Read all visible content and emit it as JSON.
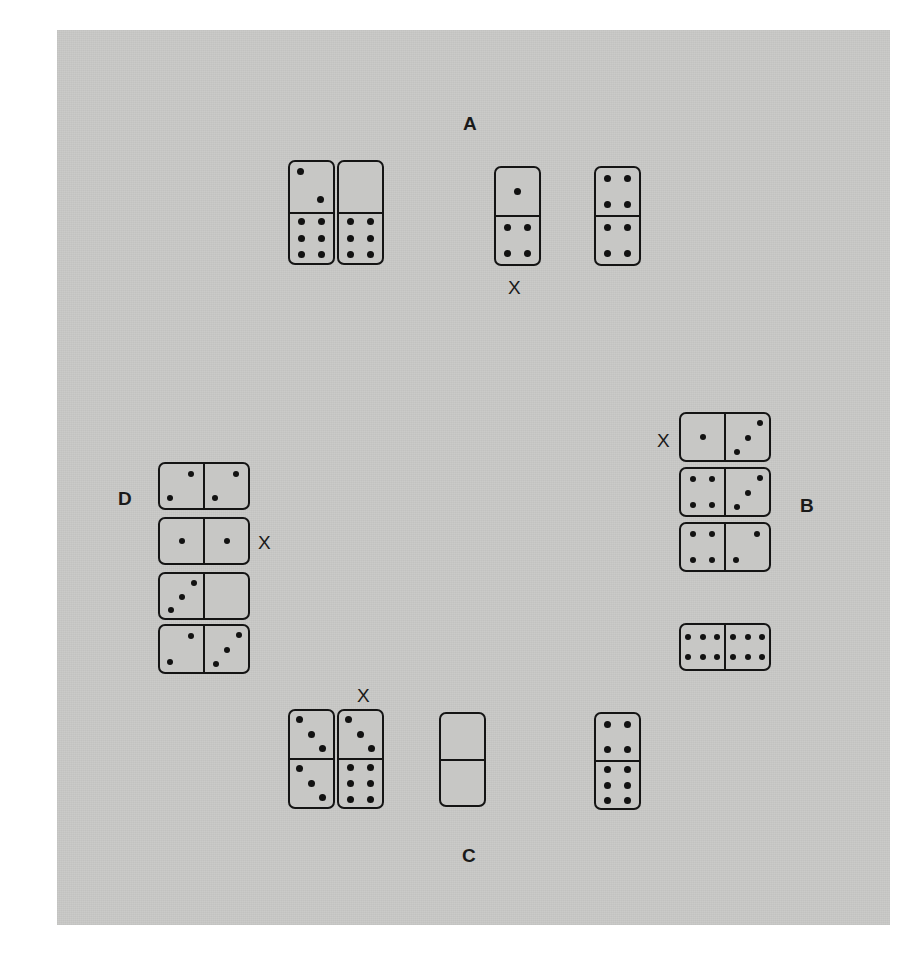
{
  "page": {
    "background_color": "#ffffff",
    "board_color": "#c9c9c7",
    "ink_color": "#141414"
  },
  "groups": [
    {
      "id": "A",
      "label": "A",
      "label_x": 463,
      "label_y": 113,
      "orientation": "vertical",
      "marked_index": 2,
      "mark_label": "X",
      "mark_x": 508,
      "mark_y": 277,
      "dominoes": [
        {
          "name": "domino-a1",
          "x": 288,
          "y": 160,
          "w": 47,
          "h": 105,
          "first": 2,
          "second": 6,
          "first_layout": "diag2-nw-se",
          "second_layout": "6"
        },
        {
          "name": "domino-a2",
          "x": 337,
          "y": 160,
          "w": 47,
          "h": 105,
          "first": 0,
          "second": 6,
          "first_layout": "0",
          "second_layout": "6"
        },
        {
          "name": "domino-a3",
          "x": 494,
          "y": 166,
          "w": 47,
          "h": 100,
          "first": 1,
          "second": 4,
          "first_layout": "1",
          "second_layout": "4"
        },
        {
          "name": "domino-a4",
          "x": 594,
          "y": 166,
          "w": 47,
          "h": 100,
          "first": 4,
          "second": 4,
          "first_layout": "4",
          "second_layout": "4"
        }
      ]
    },
    {
      "id": "B",
      "label": "B",
      "label_x": 800,
      "label_y": 495,
      "orientation": "horizontal",
      "marked_index": 0,
      "mark_label": "X",
      "mark_x": 657,
      "mark_y": 430,
      "dominoes": [
        {
          "name": "domino-b1",
          "x": 679,
          "y": 412,
          "w": 92,
          "h": 50,
          "first": 1,
          "second": 3,
          "first_layout": "1",
          "second_layout": "diag3-ne-sw"
        },
        {
          "name": "domino-b2",
          "x": 679,
          "y": 467,
          "w": 92,
          "h": 50,
          "first": 4,
          "second": 3,
          "first_layout": "4",
          "second_layout": "diag3-ne-sw"
        },
        {
          "name": "domino-b3",
          "x": 679,
          "y": 522,
          "w": 92,
          "h": 50,
          "first": 4,
          "second": 2,
          "first_layout": "4",
          "second_layout": "diag2-ne-sw"
        },
        {
          "name": "domino-b4",
          "x": 679,
          "y": 623,
          "w": 92,
          "h": 48,
          "first": 6,
          "second": 6,
          "first_layout": "6h",
          "second_layout": "6h"
        }
      ]
    },
    {
      "id": "C",
      "label": "C",
      "label_x": 462,
      "label_y": 845,
      "orientation": "vertical",
      "marked_index": 1,
      "mark_label": "X",
      "mark_x": 357,
      "mark_y": 685,
      "dominoes": [
        {
          "name": "domino-c1",
          "x": 288,
          "y": 709,
          "w": 47,
          "h": 100,
          "first": 3,
          "second": 3,
          "first_layout": "diag3-nw-se",
          "second_layout": "diag3-nw-se"
        },
        {
          "name": "domino-c2",
          "x": 337,
          "y": 709,
          "w": 47,
          "h": 100,
          "first": 3,
          "second": 6,
          "first_layout": "diag3-nw-se",
          "second_layout": "6"
        },
        {
          "name": "domino-c3",
          "x": 439,
          "y": 712,
          "w": 47,
          "h": 95,
          "first": 0,
          "second": 0,
          "first_layout": "0",
          "second_layout": "0"
        },
        {
          "name": "domino-c4",
          "x": 594,
          "y": 712,
          "w": 47,
          "h": 98,
          "first": 4,
          "second": 6,
          "first_layout": "4",
          "second_layout": "6"
        }
      ]
    },
    {
      "id": "D",
      "label": "D",
      "label_x": 118,
      "label_y": 488,
      "orientation": "horizontal",
      "marked_index": 1,
      "mark_label": "X",
      "mark_x": 258,
      "mark_y": 532,
      "dominoes": [
        {
          "name": "domino-d1",
          "x": 158,
          "y": 462,
          "w": 92,
          "h": 48,
          "first": 2,
          "second": 2,
          "first_layout": "diag2-ne-sw",
          "second_layout": "diag2-ne-sw"
        },
        {
          "name": "domino-d2",
          "x": 158,
          "y": 517,
          "w": 92,
          "h": 48,
          "first": 1,
          "second": 1,
          "first_layout": "1",
          "second_layout": "1"
        },
        {
          "name": "domino-d3",
          "x": 158,
          "y": 572,
          "w": 92,
          "h": 48,
          "first": 3,
          "second": 0,
          "first_layout": "diag3-ne-sw",
          "second_layout": "0"
        },
        {
          "name": "domino-d4",
          "x": 158,
          "y": 624,
          "w": 92,
          "h": 50,
          "first": 2,
          "second": 3,
          "first_layout": "diag2-ne-sw",
          "second_layout": "diag3-ne-sw"
        }
      ]
    }
  ],
  "pip_layouts": {
    "0": [],
    "1": [
      [
        50,
        50
      ]
    ],
    "4": [
      [
        27,
        22
      ],
      [
        73,
        22
      ],
      [
        27,
        78
      ],
      [
        73,
        78
      ]
    ],
    "6": [
      [
        27,
        17
      ],
      [
        73,
        17
      ],
      [
        27,
        50
      ],
      [
        73,
        50
      ],
      [
        27,
        83
      ],
      [
        73,
        83
      ]
    ],
    "6h": [
      [
        17,
        27
      ],
      [
        50,
        27
      ],
      [
        83,
        27
      ],
      [
        17,
        73
      ],
      [
        50,
        73
      ],
      [
        83,
        73
      ]
    ],
    "diag2-nw-se": [
      [
        24,
        20
      ],
      [
        72,
        76
      ]
    ],
    "diag2-ne-sw": [
      [
        72,
        22
      ],
      [
        24,
        78
      ]
    ],
    "diag3-nw-se": [
      [
        22,
        18
      ],
      [
        50,
        50
      ],
      [
        76,
        80
      ]
    ],
    "diag3-ne-sw": [
      [
        78,
        20
      ],
      [
        52,
        52
      ],
      [
        26,
        82
      ]
    ]
  }
}
